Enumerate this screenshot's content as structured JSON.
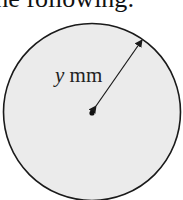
{
  "heading": {
    "text": "the following:"
  },
  "figure": {
    "shape": "circle",
    "fill_color": "#ebebeb",
    "stroke_color": "#1a1a1a",
    "radius_label": {
      "variable": "y",
      "unit": "mm"
    },
    "center_dot": true,
    "radius_arrow": "double-headed"
  }
}
